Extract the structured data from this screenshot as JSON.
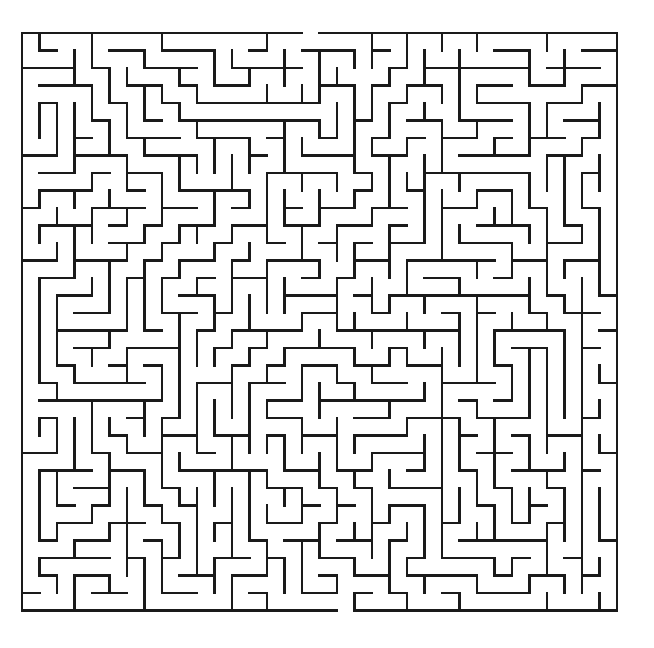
{
  "page": {
    "background_color": "#ffffff",
    "width": 654,
    "height": 648
  },
  "maze": {
    "name": "rectangular-perfect-maze",
    "description": "Black line maze puzzle on white background",
    "wall_color": "#1a1a1a",
    "wall_thickness": 2.1,
    "background_color": "#ffffff",
    "cols": 34,
    "rows": 33,
    "cell_size": 17.5,
    "origin_x": 22,
    "origin_y": 33,
    "right_x": 617,
    "bottom_y": 613,
    "entrance": {
      "side": "top",
      "col": 16,
      "x": 308,
      "y": 33
    },
    "exit": {
      "side": "bottom",
      "col": 18,
      "x": 337,
      "y": 613
    },
    "seed": 20240617,
    "type": "perfect",
    "algorithm": "depth-first-search-backtracker"
  }
}
